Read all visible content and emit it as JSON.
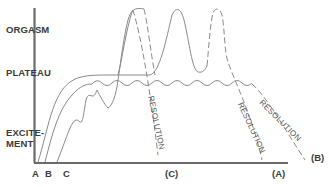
{
  "diagram": {
    "phases": {
      "orgasm": "ORGASM",
      "plateau": "PLATEAU",
      "excitement_line1": "EXCITE-",
      "excitement_line2": "MENT"
    },
    "start_labels": [
      "A",
      "B",
      "C"
    ],
    "end_labels": {
      "c": "(C)",
      "a": "(A)",
      "b": "(B)"
    },
    "resolution_label": "RESOLUTION",
    "colors": {
      "axis": "#6a6a6a",
      "curve": "#8a8a8a",
      "text": "#3a3a3a"
    },
    "curves": [
      {
        "name": "A",
        "description": "excitement, plateau, multiple orgasms, resolution"
      },
      {
        "name": "B",
        "description": "excitement, extended wavy plateau, resolution without orgasm"
      },
      {
        "name": "C",
        "description": "jagged excitement, rapid single orgasm, quick resolution"
      }
    ]
  }
}
